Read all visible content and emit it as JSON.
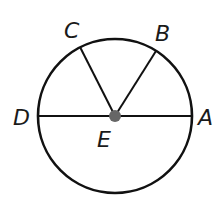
{
  "diagram": {
    "type": "circle-geometry",
    "center": {
      "label": "E",
      "x": 115,
      "y": 116
    },
    "radius": 77,
    "points": [
      {
        "id": "A",
        "label": "A",
        "x": 192,
        "y": 116,
        "label_x": 198,
        "label_y": 125
      },
      {
        "id": "B",
        "label": "B",
        "x": 156,
        "y": 51,
        "label_x": 155,
        "label_y": 41
      },
      {
        "id": "C",
        "label": "C",
        "x": 80,
        "y": 47,
        "label_x": 64,
        "label_y": 38
      },
      {
        "id": "D",
        "label": "D",
        "x": 39,
        "y": 116,
        "label_x": 13,
        "label_y": 125
      },
      {
        "id": "E",
        "label": "E",
        "x": 115,
        "y": 116,
        "label_x": 97,
        "label_y": 147
      }
    ],
    "segments": [
      {
        "from": "D",
        "to": "A",
        "name": "diameter-DA"
      },
      {
        "from": "E",
        "to": "C",
        "name": "radius-EC"
      },
      {
        "from": "E",
        "to": "B",
        "name": "radius-EB"
      }
    ],
    "colors": {
      "stroke": "#111111",
      "center_dot": "#666666"
    }
  }
}
